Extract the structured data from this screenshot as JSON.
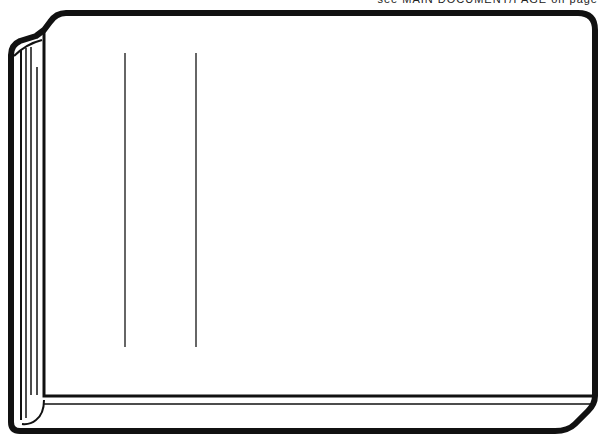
{
  "caption": {
    "text": "see MAIN DOCUMENT/PAGE on page",
    "note": "partially cropped at top edge"
  },
  "illustration": {
    "subject": "closed book / binder seen from front at slight angle",
    "stroke_color": "#111111",
    "fill_color": "#ffffff",
    "guide_lines": [
      {
        "x": 125,
        "y1": 53,
        "y2": 347
      },
      {
        "x": 196,
        "y1": 53,
        "y2": 347
      }
    ]
  }
}
